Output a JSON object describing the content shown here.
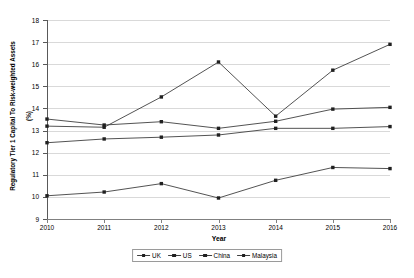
{
  "chart_data": {
    "type": "line",
    "title": "",
    "xlabel": "Year",
    "ylabel": "Regulatory Tier 1 Capital To Risk-weighted Assets\n(%)",
    "ylabel_line1": "Regulatory Tier 1 Capital To Risk-weighted Assets",
    "ylabel_line2": "(%)",
    "categories": [
      "2010",
      "2011",
      "2012",
      "2013",
      "2014",
      "2015",
      "2016"
    ],
    "x": [
      2010,
      2011,
      2012,
      2013,
      2014,
      2015,
      2016
    ],
    "ylim": [
      9,
      18
    ],
    "ytick_labels": [
      "18",
      "17",
      "16",
      "15",
      "14",
      "13",
      "12",
      "11",
      "10",
      "9"
    ],
    "yticks": [
      18,
      17,
      16,
      15,
      14,
      13,
      12,
      11,
      10,
      9
    ],
    "grid": true,
    "legend_position": "bottom-center",
    "series": [
      {
        "name": "UK",
        "marker": "square",
        "color": "#404040",
        "values": [
          13.52,
          13.25,
          13.4,
          13.1,
          13.42,
          13.97,
          14.05
        ]
      },
      {
        "name": "US",
        "marker": "square",
        "color": "#404040",
        "values": [
          12.45,
          12.62,
          12.7,
          12.8,
          13.1,
          13.1,
          13.18
        ]
      },
      {
        "name": "China",
        "marker": "square",
        "color": "#404040",
        "values": [
          13.2,
          13.15,
          14.52,
          16.1,
          13.65,
          15.73,
          16.9
        ]
      },
      {
        "name": "Malaysia",
        "marker": "square",
        "color": "#404040",
        "values": [
          10.05,
          10.22,
          10.6,
          9.95,
          10.75,
          11.33,
          11.28
        ]
      }
    ]
  },
  "legend": {
    "items": [
      {
        "label": "UK"
      },
      {
        "label": "US"
      },
      {
        "label": "China"
      },
      {
        "label": "Malaysia"
      }
    ]
  }
}
